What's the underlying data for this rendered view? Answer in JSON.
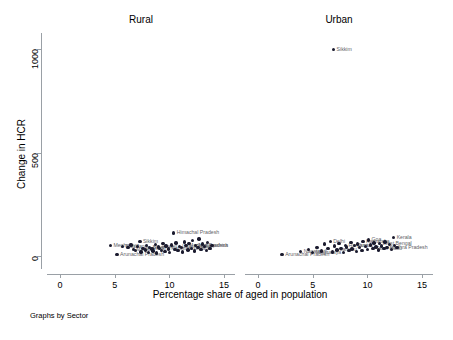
{
  "chart_data": {
    "type": "scatter",
    "title": "",
    "xlabel": "Percentage share of aged in population",
    "ylabel": "Change in HCR",
    "note": "Graphs by Sector",
    "xlim": [
      -1.2,
      16.0
    ],
    "ylim": [
      -60,
      1080
    ],
    "xticks": [
      0,
      5,
      10,
      15
    ],
    "yticks": [
      0,
      500,
      1000
    ],
    "xtick_labels": [
      "0",
      "5",
      "10",
      "15"
    ],
    "ytick_labels": [
      "0",
      "500",
      "1000"
    ],
    "grid": false,
    "legend": "none",
    "marker_color": "#1a1a2e",
    "label_color": "#5f6368",
    "axis_color": "#9aa0a6",
    "panels": [
      {
        "name": "Rural",
        "label": "Rural",
        "points": [
          {
            "x": 4.6,
            "y": 48,
            "label": "Meghalaya",
            "lpos": "right"
          },
          {
            "x": 5.2,
            "y": 5,
            "label": "Arunachal Pradesh",
            "lpos": "right"
          },
          {
            "x": 5.7,
            "y": 45,
            "label": "Nagaland",
            "lpos": "right"
          },
          {
            "x": 6.2,
            "y": 38,
            "label": "",
            "lpos": "right"
          },
          {
            "x": 6.5,
            "y": 52,
            "label": "",
            "lpos": "right"
          },
          {
            "x": 6.7,
            "y": 30,
            "label": "Manipur",
            "lpos": "right"
          },
          {
            "x": 6.9,
            "y": 24,
            "label": "",
            "lpos": "right"
          },
          {
            "x": 7.1,
            "y": 44,
            "label": "",
            "lpos": "right"
          },
          {
            "x": 7.3,
            "y": 70,
            "label": "Sikkim",
            "lpos": "right"
          },
          {
            "x": 7.4,
            "y": 18,
            "label": "",
            "lpos": "right"
          },
          {
            "x": 7.6,
            "y": 35,
            "label": "Jharkhand",
            "lpos": "right"
          },
          {
            "x": 7.8,
            "y": 28,
            "label": "",
            "lpos": "right"
          },
          {
            "x": 7.9,
            "y": 50,
            "label": "",
            "lpos": "right"
          },
          {
            "x": 8.1,
            "y": 14,
            "label": "",
            "lpos": "right"
          },
          {
            "x": 8.2,
            "y": 40,
            "label": "Bihar",
            "lpos": "right"
          },
          {
            "x": 8.4,
            "y": 32,
            "label": "",
            "lpos": "right"
          },
          {
            "x": 8.5,
            "y": 22,
            "label": "",
            "lpos": "right"
          },
          {
            "x": 8.7,
            "y": 55,
            "label": "",
            "lpos": "right"
          },
          {
            "x": 8.8,
            "y": 12,
            "label": "",
            "lpos": "right"
          },
          {
            "x": 9.0,
            "y": 42,
            "label": "Assam",
            "lpos": "right"
          },
          {
            "x": 9.1,
            "y": 36,
            "label": "",
            "lpos": "right"
          },
          {
            "x": 9.3,
            "y": 26,
            "label": "",
            "lpos": "right"
          },
          {
            "x": 9.4,
            "y": 60,
            "label": "",
            "lpos": "right"
          },
          {
            "x": 9.6,
            "y": 20,
            "label": "",
            "lpos": "right"
          },
          {
            "x": 9.7,
            "y": 46,
            "label": "",
            "lpos": "right"
          },
          {
            "x": 9.9,
            "y": 33,
            "label": "Rajasthan",
            "lpos": "right"
          },
          {
            "x": 10.0,
            "y": 16,
            "label": "",
            "lpos": "right"
          },
          {
            "x": 10.2,
            "y": 52,
            "label": "",
            "lpos": "right"
          },
          {
            "x": 10.4,
            "y": 110,
            "label": "Himachal Pradesh",
            "lpos": "right"
          },
          {
            "x": 10.5,
            "y": 30,
            "label": "",
            "lpos": "right"
          },
          {
            "x": 10.6,
            "y": 62,
            "label": "",
            "lpos": "right"
          },
          {
            "x": 10.8,
            "y": 24,
            "label": "",
            "lpos": "right"
          },
          {
            "x": 10.9,
            "y": 44,
            "label": "Uttar Pradesh",
            "lpos": "right"
          },
          {
            "x": 11.1,
            "y": 38,
            "label": "",
            "lpos": "right"
          },
          {
            "x": 11.2,
            "y": 18,
            "label": "",
            "lpos": "right"
          },
          {
            "x": 11.4,
            "y": 66,
            "label": "",
            "lpos": "right"
          },
          {
            "x": 11.5,
            "y": 48,
            "label": "Madhya Pradesh",
            "lpos": "right"
          },
          {
            "x": 11.7,
            "y": 28,
            "label": "",
            "lpos": "right"
          },
          {
            "x": 11.8,
            "y": 58,
            "label": "",
            "lpos": "right"
          },
          {
            "x": 12.0,
            "y": 34,
            "label": "Gujarat",
            "lpos": "right"
          },
          {
            "x": 12.1,
            "y": 72,
            "label": "",
            "lpos": "right"
          },
          {
            "x": 12.3,
            "y": 22,
            "label": "",
            "lpos": "right"
          },
          {
            "x": 12.4,
            "y": 50,
            "label": "Maharashtra",
            "lpos": "right"
          },
          {
            "x": 12.6,
            "y": 40,
            "label": "",
            "lpos": "right"
          },
          {
            "x": 12.7,
            "y": 80,
            "label": "",
            "lpos": "right"
          },
          {
            "x": 12.9,
            "y": 30,
            "label": "",
            "lpos": "right"
          },
          {
            "x": 13.0,
            "y": 56,
            "label": "",
            "lpos": "right"
          },
          {
            "x": 13.2,
            "y": 44,
            "label": "",
            "lpos": "right"
          },
          {
            "x": 13.4,
            "y": 26,
            "label": "",
            "lpos": "right"
          },
          {
            "x": 13.5,
            "y": 64,
            "label": "",
            "lpos": "right"
          },
          {
            "x": 13.7,
            "y": 36,
            "label": "",
            "lpos": "right"
          },
          {
            "x": 13.9,
            "y": 48,
            "label": "",
            "lpos": "right"
          }
        ]
      },
      {
        "name": "Urban",
        "label": "Urban",
        "points": [
          {
            "x": 6.9,
            "y": 1000,
            "label": "Sikkim",
            "lpos": "right"
          },
          {
            "x": 2.2,
            "y": 4,
            "label": "Arunachal Pradesh",
            "lpos": "right"
          },
          {
            "x": 3.9,
            "y": 20,
            "label": "Nagaland",
            "lpos": "right"
          },
          {
            "x": 4.6,
            "y": 30,
            "label": "",
            "lpos": "right"
          },
          {
            "x": 5.0,
            "y": 14,
            "label": "Meghalaya",
            "lpos": "right"
          },
          {
            "x": 5.4,
            "y": 40,
            "label": "",
            "lpos": "right"
          },
          {
            "x": 5.8,
            "y": 22,
            "label": "",
            "lpos": "right"
          },
          {
            "x": 6.1,
            "y": 56,
            "label": "",
            "lpos": "right"
          },
          {
            "x": 6.4,
            "y": 34,
            "label": "",
            "lpos": "right"
          },
          {
            "x": 6.6,
            "y": 70,
            "label": "Delhi",
            "lpos": "right"
          },
          {
            "x": 6.8,
            "y": 18,
            "label": "",
            "lpos": "right"
          },
          {
            "x": 7.0,
            "y": 46,
            "label": "",
            "lpos": "right"
          },
          {
            "x": 7.2,
            "y": 28,
            "label": "Jammu",
            "lpos": "right"
          },
          {
            "x": 7.4,
            "y": 60,
            "label": "",
            "lpos": "right"
          },
          {
            "x": 7.6,
            "y": 36,
            "label": "",
            "lpos": "right"
          },
          {
            "x": 7.8,
            "y": 16,
            "label": "",
            "lpos": "right"
          },
          {
            "x": 8.0,
            "y": 50,
            "label": "Haryana",
            "lpos": "right"
          },
          {
            "x": 8.1,
            "y": 42,
            "label": "",
            "lpos": "right"
          },
          {
            "x": 8.3,
            "y": 24,
            "label": "",
            "lpos": "right"
          },
          {
            "x": 8.5,
            "y": 64,
            "label": "",
            "lpos": "right"
          },
          {
            "x": 8.6,
            "y": 32,
            "label": "",
            "lpos": "right"
          },
          {
            "x": 8.8,
            "y": 48,
            "label": "Punjab",
            "lpos": "right"
          },
          {
            "x": 9.0,
            "y": 20,
            "label": "",
            "lpos": "right"
          },
          {
            "x": 9.1,
            "y": 56,
            "label": "",
            "lpos": "right"
          },
          {
            "x": 9.3,
            "y": 38,
            "label": "",
            "lpos": "right"
          },
          {
            "x": 9.5,
            "y": 26,
            "label": "",
            "lpos": "right"
          },
          {
            "x": 9.6,
            "y": 68,
            "label": "Karnataka",
            "lpos": "right"
          },
          {
            "x": 9.8,
            "y": 44,
            "label": "",
            "lpos": "right"
          },
          {
            "x": 10.0,
            "y": 30,
            "label": "",
            "lpos": "right"
          },
          {
            "x": 10.1,
            "y": 76,
            "label": "Goa",
            "lpos": "right"
          },
          {
            "x": 10.3,
            "y": 52,
            "label": "",
            "lpos": "right"
          },
          {
            "x": 10.5,
            "y": 36,
            "label": "Tamil Nadu",
            "lpos": "right"
          },
          {
            "x": 10.6,
            "y": 62,
            "label": "",
            "lpos": "right"
          },
          {
            "x": 10.8,
            "y": 42,
            "label": "",
            "lpos": "right"
          },
          {
            "x": 11.0,
            "y": 28,
            "label": "",
            "lpos": "right"
          },
          {
            "x": 11.1,
            "y": 58,
            "label": "West Bengal",
            "lpos": "right"
          },
          {
            "x": 11.3,
            "y": 46,
            "label": "",
            "lpos": "right"
          },
          {
            "x": 11.5,
            "y": 34,
            "label": "",
            "lpos": "right"
          },
          {
            "x": 11.6,
            "y": 66,
            "label": "",
            "lpos": "right"
          },
          {
            "x": 11.8,
            "y": 40,
            "label": "Andhra Pradesh",
            "lpos": "right"
          },
          {
            "x": 12.0,
            "y": 54,
            "label": "",
            "lpos": "right"
          },
          {
            "x": 12.2,
            "y": 30,
            "label": "",
            "lpos": "right"
          },
          {
            "x": 12.4,
            "y": 88,
            "label": "Kerala",
            "lpos": "right"
          },
          {
            "x": 12.5,
            "y": 48,
            "label": "",
            "lpos": "right"
          },
          {
            "x": 12.7,
            "y": 38,
            "label": "",
            "lpos": "right"
          }
        ]
      }
    ]
  }
}
